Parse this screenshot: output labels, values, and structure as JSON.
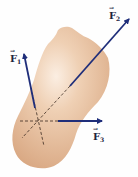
{
  "diagram": {
    "type": "force-diagram",
    "colors": {
      "body_fill": "#e6bc98",
      "body_highlight": "#fbeee2",
      "arrow": "#1f2e7a",
      "dashed_line": "#3a2a20",
      "label": "#1c2440"
    },
    "forces": [
      {
        "id": "F1",
        "label": "F",
        "subscript": "1",
        "vector_symbol": "→"
      },
      {
        "id": "F2",
        "label": "F",
        "subscript": "2",
        "vector_symbol": "→"
      },
      {
        "id": "F3",
        "label": "F",
        "subscript": "3",
        "vector_symbol": "→"
      }
    ]
  }
}
